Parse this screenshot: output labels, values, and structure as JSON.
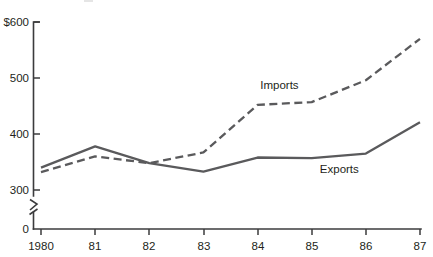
{
  "chart_data": {
    "type": "line",
    "title": "",
    "subtitle": "",
    "xlabel": "",
    "ylabel": "",
    "x": [
      1980,
      1981,
      1982,
      1983,
      1984,
      1985,
      1986,
      1987
    ],
    "categories": [
      "1980",
      "81",
      "82",
      "83",
      "84",
      "85",
      "86",
      "87"
    ],
    "series": [
      {
        "name": "Exports",
        "style": "solid",
        "color": "#5a5a5c",
        "values": [
          340,
          378,
          348,
          333,
          358,
          357,
          365,
          421
        ]
      },
      {
        "name": "Imports",
        "style": "dashed",
        "color": "#5a5a5c",
        "values": [
          332,
          360,
          348,
          367,
          452,
          457,
          496,
          570
        ]
      }
    ],
    "ylim": [
      300,
      600
    ],
    "yticks": [
      300,
      400,
      500,
      600
    ],
    "ytick_labels": [
      "300",
      "400",
      "500",
      "600"
    ],
    "y_axis_top_label": "$600",
    "y_axis_zero_label": "0",
    "y_axis_break": true,
    "grid": false,
    "legend": "inline-annotations",
    "annotations": [
      {
        "text": "Imports",
        "x": 1984.05,
        "y": 487
      },
      {
        "text": "Exports",
        "x": 1985.15,
        "y": 337
      }
    ],
    "units": "billions of dollars"
  },
  "axis": {
    "y_labels": [
      "$600",
      "500",
      "400",
      "300",
      "0"
    ],
    "x_labels": [
      "1980",
      "81",
      "82",
      "83",
      "84",
      "85",
      "86",
      "87"
    ]
  },
  "series_labels": {
    "imports": "Imports",
    "exports": "Exports"
  },
  "colors": {
    "line": "#5a5a5c",
    "axis": "#3b3b3d",
    "text": "#231f20",
    "background": "#ffffff"
  }
}
